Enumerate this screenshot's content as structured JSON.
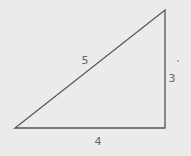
{
  "diagram": {
    "type": "right-triangle",
    "colors": {
      "background": "#ebebeb",
      "stroke": "#555555",
      "label": "#666666"
    },
    "vertices": {
      "bottom_left": [
        15,
        128
      ],
      "bottom_right": [
        165,
        128
      ],
      "top_right": [
        165,
        10
      ]
    },
    "sides": {
      "hypotenuse": {
        "label": "5",
        "pos": [
          85,
          60
        ]
      },
      "vertical": {
        "label": "3",
        "pos": [
          172,
          78
        ]
      },
      "horizontal": {
        "label": "4",
        "pos": [
          98,
          141
        ]
      }
    },
    "mark": {
      "pos": [
        178,
        61
      ]
    }
  }
}
